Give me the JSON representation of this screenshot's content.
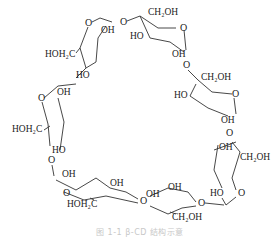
{
  "figure": {
    "caption": "图 1-1  β-CD 结构示意"
  },
  "labels": {
    "top_left_unit": {
      "ring_o": "O",
      "oh": "OH",
      "ch2": "HOH₂C",
      "ho": "HO"
    },
    "top_unit": {
      "link_o": "O",
      "ch2": "CH₂OH",
      "ho": "HO",
      "ring_o": "O",
      "oh": "OH"
    },
    "right_upper_unit": {
      "link_o": "O",
      "ch2": "CH₂OH",
      "ho": "HO",
      "ring_o": "O",
      "oh": "OH"
    },
    "right_lower_unit": {
      "link_o": "O",
      "oh": "OH",
      "ch2": "CH₂OH",
      "ho": "HO",
      "ring_o": "O"
    },
    "bottom_right_unit": {
      "oh": "OH",
      "ch2": "CH₂OH",
      "ring_o": "O",
      "link_o": "O",
      "ho": "HO"
    },
    "bottom_left_unit": {
      "oh1": "OH",
      "oh2": "OH",
      "ring_o": "O",
      "ch2": "HOH₂C",
      "link_o": "O"
    },
    "left_unit": {
      "ring_o": "O",
      "oh": "OH",
      "ch2": "HOH₂C",
      "ho": "HO",
      "link_o": "O"
    }
  }
}
